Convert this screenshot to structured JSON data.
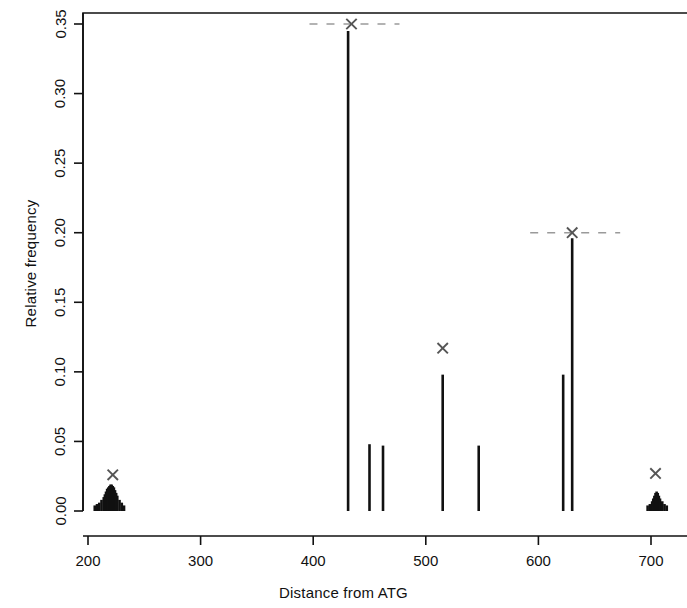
{
  "figure": {
    "xlabel": "Distance from ATG",
    "ylabel": "Relative frequency"
  },
  "chart_data": {
    "type": "bar",
    "title": "",
    "subtitle": "",
    "xlabel": "Distance from ATG",
    "ylabel": "Relative frequency",
    "xlim": [
      185,
      720
    ],
    "ylim": [
      0.0,
      0.355
    ],
    "grid": false,
    "legend": null,
    "x_ticks": [
      200,
      300,
      400,
      500,
      600,
      700
    ],
    "x_tick_labels": [
      "200",
      "300",
      "400",
      "500",
      "600",
      "700"
    ],
    "y_ticks": [
      0.0,
      0.05,
      0.1,
      0.15,
      0.2,
      0.25,
      0.3,
      0.35
    ],
    "y_tick_labels": [
      "0.00",
      "0.05",
      "0.10",
      "0.15",
      "0.20",
      "0.25",
      "0.30",
      "0.35"
    ],
    "bar_color": "#111111",
    "marker_color": "#555555",
    "x": [
      206,
      208,
      210,
      212,
      214,
      215,
      216,
      217,
      218,
      219,
      220,
      221,
      222,
      223,
      224,
      225,
      226,
      228,
      230,
      232,
      431,
      450,
      462,
      515,
      547,
      622,
      630,
      697,
      699,
      701,
      702,
      703,
      704,
      705,
      706,
      707,
      708,
      710,
      712,
      714
    ],
    "values": [
      0.004,
      0.005,
      0.006,
      0.008,
      0.01,
      0.012,
      0.014,
      0.016,
      0.017,
      0.018,
      0.019,
      0.019,
      0.018,
      0.017,
      0.015,
      0.013,
      0.011,
      0.008,
      0.006,
      0.004,
      0.345,
      0.048,
      0.047,
      0.098,
      0.047,
      0.098,
      0.196,
      0.004,
      0.005,
      0.007,
      0.009,
      0.011,
      0.013,
      0.014,
      0.013,
      0.011,
      0.009,
      0.007,
      0.005,
      0.004
    ],
    "markers": [
      {
        "name": "marker-left-cluster",
        "x": 222,
        "y": 0.026,
        "dashes": false
      },
      {
        "name": "marker-peak-431",
        "x": 434,
        "y": 0.35,
        "dashes": true
      },
      {
        "name": "marker-mid-515",
        "x": 515,
        "y": 0.117,
        "dashes": false
      },
      {
        "name": "marker-peak-630",
        "x": 630,
        "y": 0.2,
        "dashes": true
      },
      {
        "name": "marker-right-cluster",
        "x": 704,
        "y": 0.027,
        "dashes": false
      }
    ]
  }
}
